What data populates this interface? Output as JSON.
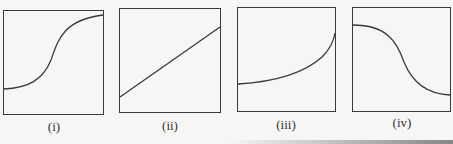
{
  "figure": {
    "stroke_color": "#3a3a3a",
    "panels": [
      {
        "id": "i",
        "label": "(i)",
        "curve": "sigmoid-increasing",
        "description": "S-shaped curve rising from low-left to high-right"
      },
      {
        "id": "ii",
        "label": "(ii)",
        "curve": "linear-increasing",
        "description": "Straight line rising from bottom-left to top-right"
      },
      {
        "id": "iii",
        "label": "(iii)",
        "curve": "exponential-increasing",
        "description": "Curve flat at first then rising steeply at right"
      },
      {
        "id": "iv",
        "label": "(iv)",
        "curve": "sigmoid-decreasing",
        "description": "Reverse S-shaped curve falling from high-left to low-right"
      }
    ]
  }
}
